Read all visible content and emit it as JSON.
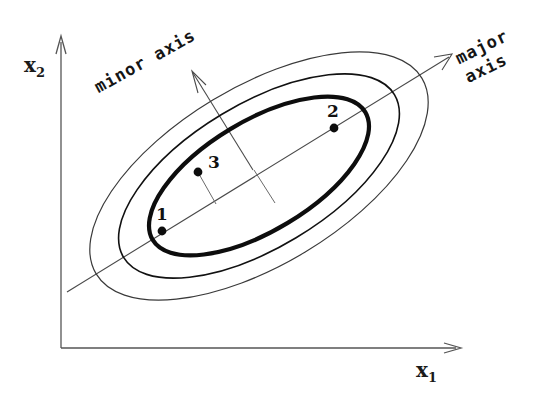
{
  "figure": {
    "kind": "concentric-ellipse-contour-diagram",
    "axes": {
      "x_label": "x",
      "x_sub": "1",
      "y_label": "x",
      "y_sub": "2"
    },
    "annotations": {
      "minor_axis": "minor axis",
      "major_axis_line1": "major",
      "major_axis_line2": "axis"
    },
    "points": [
      {
        "label": "1",
        "x": 162,
        "y": 231
      },
      {
        "label": "2",
        "x": 334,
        "y": 128
      },
      {
        "label": "3",
        "x": 198,
        "y": 172
      }
    ],
    "colors": {
      "ink": "#111111",
      "thin_line": "#444444",
      "axis": "#555555",
      "background": "#ffffff"
    },
    "ellipses": {
      "center_x": 259,
      "center_y": 176,
      "rotation_deg": -31,
      "contours": [
        {
          "name": "inner",
          "rx": 124,
          "ry": 55,
          "stroke_width": 1.6
        },
        {
          "name": "middle",
          "rx": 158,
          "ry": 72,
          "stroke_width": 3.6
        },
        {
          "name": "outer",
          "rx": 190,
          "ry": 89,
          "stroke_width": 1.3
        }
      ]
    }
  }
}
